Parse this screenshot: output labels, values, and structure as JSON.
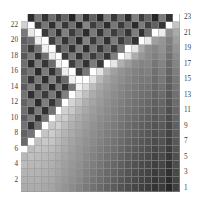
{
  "figure": {
    "title": "",
    "kind": "matrix-heatmap",
    "background_color": "#ffffff",
    "grid_line_color": "#9a9a9a"
  },
  "axes": {
    "left": {
      "name": "left-axis",
      "ticks": [
        "22",
        "20",
        "18",
        "16",
        "14",
        "12",
        "10",
        "8",
        "6",
        "4",
        "2"
      ],
      "tick_values": [
        22,
        20,
        18,
        16,
        14,
        12,
        10,
        8,
        6,
        4,
        2
      ],
      "label": ""
    },
    "right": {
      "name": "right-axis",
      "ticks": [
        "23",
        "21",
        "19",
        "17",
        "15",
        "13",
        "11",
        "9",
        "7",
        "5",
        "3",
        "1"
      ],
      "tick_values": [
        23,
        21,
        19,
        17,
        15,
        13,
        11,
        9,
        7,
        5,
        3,
        1
      ],
      "label": ""
    },
    "bottom": {
      "ticks": [],
      "label": ""
    },
    "top": {
      "ticks": [],
      "label": ""
    }
  },
  "chart_data": {
    "type": "heatmap",
    "title": "",
    "xlabel": "",
    "ylabel": "",
    "nrows": 23,
    "ncols": 23,
    "row_labels": [
      "23",
      "22",
      "21",
      "20",
      "19",
      "18",
      "17",
      "16",
      "15",
      "14",
      "13",
      "12",
      "11",
      "10",
      "9",
      "8",
      "7",
      "6",
      "5",
      "4",
      "3",
      "2",
      "1"
    ],
    "col_labels": [
      "1",
      "2",
      "3",
      "4",
      "5",
      "6",
      "7",
      "8",
      "9",
      "10",
      "11",
      "12",
      "13",
      "14",
      "15",
      "16",
      "17",
      "18",
      "19",
      "20",
      "21",
      "22",
      "23"
    ],
    "colormap": "grayscale",
    "vmin": 0,
    "vmax": 255,
    "legend": "none",
    "grid": true,
    "note": "Greyscale intensity matrix; two near-white diagonals cross forming a V/X; upper region predominantly dark, lower-right region predominantly light.",
    "values": [
      [
        255,
        44,
        120,
        52,
        110,
        58,
        102,
        36,
        130,
        48,
        96,
        40,
        124,
        56,
        108,
        44,
        128,
        60,
        100,
        38,
        122,
        50,
        255
      ],
      [
        208,
        255,
        60,
        118,
        48,
        126,
        54,
        112,
        40,
        132,
        62,
        104,
        46,
        120,
        58,
        108,
        42,
        124,
        64,
        98,
        52,
        255,
        196
      ],
      [
        120,
        232,
        255,
        56,
        114,
        46,
        128,
        60,
        106,
        44,
        122,
        50,
        116,
        62,
        100,
        54,
        126,
        48,
        110,
        255,
        236,
        146,
        170
      ],
      [
        96,
        110,
        238,
        255,
        62,
        120,
        52,
        108,
        42,
        130,
        58,
        114,
        48,
        124,
        60,
        102,
        50,
        255,
        232,
        160,
        150,
        128,
        158
      ],
      [
        104,
        58,
        116,
        240,
        255,
        64,
        110,
        50,
        126,
        46,
        118,
        56,
        108,
        60,
        120,
        255,
        230,
        168,
        142,
        134,
        146,
        120,
        148
      ],
      [
        88,
        124,
        50,
        112,
        236,
        255,
        58,
        122,
        48,
        114,
        60,
        104,
        52,
        128,
        255,
        226,
        172,
        150,
        138,
        128,
        140,
        112,
        140
      ],
      [
        112,
        46,
        126,
        54,
        108,
        242,
        255,
        62,
        116,
        50,
        124,
        58,
        255,
        230,
        176,
        156,
        140,
        132,
        134,
        118,
        132,
        106,
        132
      ],
      [
        96,
        118,
        42,
        124,
        50,
        110,
        238,
        255,
        60,
        120,
        255,
        228,
        180,
        160,
        148,
        138,
        130,
        124,
        128,
        112,
        126,
        100,
        126
      ],
      [
        108,
        52,
        120,
        46,
        128,
        56,
        106,
        240,
        255,
        255,
        224,
        184,
        164,
        152,
        142,
        134,
        126,
        120,
        122,
        108,
        120,
        96,
        120
      ],
      [
        92,
        126,
        56,
        114,
        44,
        122,
        52,
        116,
        242,
        220,
        188,
        168,
        156,
        146,
        136,
        128,
        122,
        116,
        116,
        104,
        114,
        92,
        116
      ],
      [
        116,
        48,
        110,
        58,
        120,
        50,
        128,
        255,
        216,
        192,
        172,
        160,
        150,
        140,
        132,
        124,
        118,
        112,
        110,
        100,
        108,
        88,
        112
      ],
      [
        100,
        120,
        44,
        126,
        54,
        112,
        255,
        212,
        196,
        176,
        164,
        154,
        144,
        136,
        128,
        120,
        114,
        108,
        104,
        96,
        102,
        84,
        108
      ],
      [
        110,
        54,
        122,
        48,
        116,
        255,
        208,
        200,
        180,
        168,
        158,
        148,
        140,
        132,
        124,
        116,
        110,
        104,
        100,
        92,
        98,
        80,
        104
      ],
      [
        94,
        124,
        50,
        118,
        255,
        204,
        204,
        184,
        172,
        162,
        152,
        142,
        136,
        128,
        120,
        112,
        106,
        100,
        96,
        88,
        94,
        76,
        100
      ],
      [
        114,
        50,
        114,
        255,
        200,
        208,
        188,
        176,
        166,
        156,
        146,
        138,
        130,
        124,
        116,
        108,
        102,
        96,
        92,
        84,
        90,
        72,
        96
      ],
      [
        98,
        116,
        255,
        196,
        204,
        192,
        180,
        170,
        160,
        150,
        142,
        134,
        126,
        120,
        112,
        104,
        98,
        92,
        88,
        80,
        86,
        68,
        92
      ],
      [
        106,
        255,
        192,
        200,
        196,
        184,
        174,
        164,
        154,
        146,
        138,
        130,
        122,
        116,
        108,
        100,
        94,
        88,
        84,
        76,
        82,
        64,
        88
      ],
      [
        255,
        188,
        196,
        192,
        188,
        180,
        170,
        160,
        150,
        142,
        134,
        126,
        118,
        112,
        104,
        96,
        90,
        84,
        80,
        72,
        78,
        60,
        84
      ],
      [
        184,
        192,
        188,
        184,
        180,
        172,
        164,
        156,
        148,
        138,
        130,
        122,
        114,
        108,
        100,
        92,
        86,
        80,
        76,
        68,
        74,
        56,
        80
      ],
      [
        188,
        184,
        184,
        180,
        176,
        168,
        160,
        152,
        144,
        134,
        126,
        118,
        110,
        104,
        96,
        88,
        82,
        76,
        72,
        64,
        70,
        52,
        76
      ],
      [
        180,
        180,
        180,
        176,
        172,
        164,
        156,
        148,
        140,
        130,
        122,
        114,
        106,
        100,
        92,
        84,
        78,
        72,
        68,
        60,
        66,
        48,
        72
      ],
      [
        176,
        176,
        176,
        172,
        168,
        160,
        152,
        144,
        136,
        126,
        118,
        110,
        102,
        96,
        88,
        80,
        74,
        68,
        64,
        56,
        62,
        44,
        68
      ],
      [
        172,
        172,
        172,
        168,
        164,
        156,
        148,
        140,
        132,
        122,
        114,
        106,
        98,
        92,
        84,
        76,
        70,
        64,
        60,
        52,
        58,
        40,
        64
      ]
    ]
  }
}
